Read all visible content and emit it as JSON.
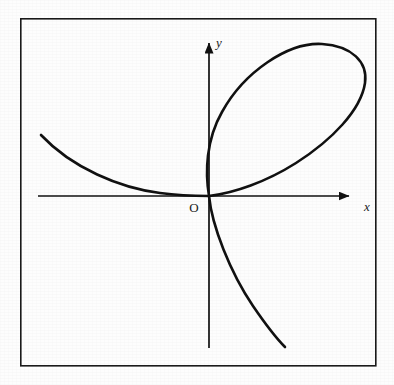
{
  "figure": {
    "background_color": "#fdfdfd",
    "ink_color": "#111111",
    "frame": {
      "name": "figure-border",
      "x": 20,
      "y": 18,
      "width": 356,
      "height": 348,
      "stroke_width": 1.6,
      "color": "#1a1a1a"
    },
    "origin_label": "O",
    "x_axis_label": "x",
    "y_axis_label": "y"
  },
  "chart_data": {
    "type": "line",
    "title": "",
    "subtitle": "",
    "xlabel": "x",
    "ylabel": "y",
    "grid": false,
    "legend": "none",
    "annotations": [
      "O"
    ],
    "axes": {
      "origin_px": [
        209,
        196
      ],
      "x_axis": {
        "label": "x",
        "start_px": [
          38,
          196
        ],
        "arrow_tip_px": [
          360,
          196
        ],
        "label_px": [
          364,
          211
        ],
        "arrowhead": true
      },
      "y_axis": {
        "label": "y",
        "arrow_tip_px": [
          209,
          32
        ],
        "end_px": [
          209,
          348
        ],
        "label_px": [
          216,
          47
        ],
        "arrowhead": true
      }
    },
    "curve": {
      "name": "nodal-cubic-curve",
      "description": "Single cubic curve with a node (self-intersection) at the origin: a closed loop in the first quadrant plus two infinite branches.",
      "stroke_width": 2.6,
      "color": "#111111",
      "features": {
        "node_px": [
          209,
          196
        ],
        "loop_top_px": [
          330,
          45
        ],
        "loop_rightmost_px": [
          365,
          76
        ],
        "loop_leftmost_px": [
          206,
          150
        ],
        "left_branch_end_px": [
          41,
          135
        ],
        "lower_branch_end_px": [
          285,
          347
        ]
      },
      "segments": [
        {
          "name": "left-branch",
          "path": "M 41 135 C 72 168, 120 188, 160 193 C 182 196, 198 196, 209 196"
        },
        {
          "name": "loop",
          "path": "M 209 196 C 205 172, 206 140, 222 112 C 244 72, 288 42, 322 44 C 352 46, 368 62, 365 83 C 361 110, 332 140, 296 163 C 266 182, 234 193, 209 196"
        },
        {
          "name": "lower-branch",
          "path": "M 209 196 C 212 226, 230 272, 253 306 C 266 325, 277 339, 285 347"
        }
      ],
      "x": [],
      "y": []
    }
  }
}
